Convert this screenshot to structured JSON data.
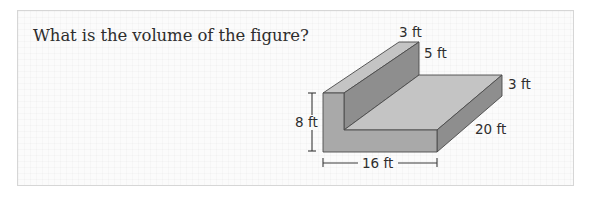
{
  "question": {
    "text": "What is the volume of the figure?"
  },
  "figure": {
    "type": "L-shaped prism",
    "labels": {
      "wall_top_width": "3 ft",
      "wall_height": "5 ft",
      "base_thickness": "3 ft",
      "depth": "20 ft",
      "total_height": "8 ft",
      "front_width": "16 ft"
    },
    "colors": {
      "top_face": "#c2c2c2",
      "front_face": "#a8a8a8",
      "dark_face": "#8c8c8c",
      "edge": "#4a4a4a"
    }
  }
}
